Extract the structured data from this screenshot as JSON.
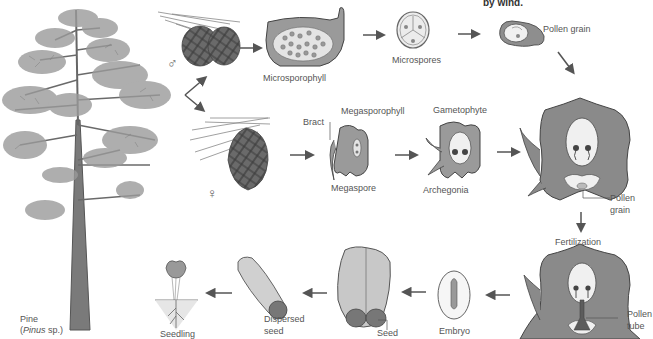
{
  "diagram": {
    "caption_fragment": "by wind.",
    "colors": {
      "tissue": "#8a8a8a",
      "tissue_dark": "#6e6e6e",
      "tissue_light": "#d8d8d8",
      "outline": "#4a4a4a",
      "arrow": "#555555",
      "text": "#555555"
    },
    "labels": {
      "pine": "Pine",
      "pine_species": "Pinus",
      "pine_species_suffix": " sp.)",
      "pine_species_prefix": "(",
      "microsporophyll": "Microsporophyll",
      "microspores": "Microspores",
      "pollen_grain_top": "Pollen grain",
      "bract": "Bract",
      "megasporophyll": "Megasporophyll",
      "megaspore": "Megaspore",
      "gametophyte": "Gametophyte",
      "archegonia": "Archegonia",
      "pollen_grain_ovule_1": "Pollen",
      "pollen_grain_ovule_2": "grain",
      "fertilization": "Fertilization",
      "pollen_tube_1": "Pollen",
      "pollen_tube_2": "tube",
      "embryo": "Embryo",
      "seed": "Seed",
      "dispersed_seed_1": "Dispersed",
      "dispersed_seed_2": "seed",
      "seedling": "Seedling",
      "male_symbol": "♂",
      "female_symbol": "♀"
    },
    "stages": [
      "Pine (Pinus sp.)",
      "Male cone",
      "Microsporophyll",
      "Microspores",
      "Pollen grain",
      "Female cone",
      "Megasporophyll / Megaspore",
      "Gametophyte / Archegonia",
      "Ovule with pollen grain",
      "Fertilization (pollen tube)",
      "Embryo",
      "Seed",
      "Dispersed seed",
      "Seedling"
    ]
  }
}
